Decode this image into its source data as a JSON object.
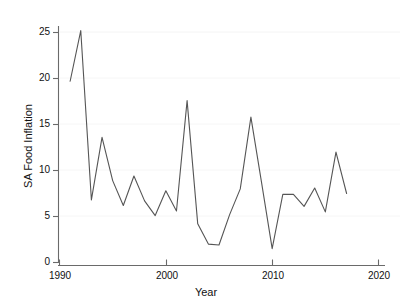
{
  "chart_data": {
    "type": "line",
    "title": "",
    "xlabel": "Year",
    "ylabel": "SA Food Inflation",
    "xlim": [
      1988.8,
      2022.5
    ],
    "ylim": [
      -1.2,
      26.8
    ],
    "xticks": [
      1990,
      2000,
      2010,
      2020
    ],
    "xtick_labels": [
      "1990",
      "2000",
      "2010",
      "2020"
    ],
    "yticks": [
      0,
      5,
      10,
      15,
      20,
      25
    ],
    "ytick_labels": [
      "0",
      "5",
      "10",
      "15",
      "20",
      "25"
    ],
    "grid": false,
    "legend": "none",
    "line_color": "#555555",
    "axis_color": "#555555",
    "background": "#ffffff",
    "x": [
      1991,
      1992,
      1993,
      1994,
      1995,
      1996,
      1997,
      1998,
      1999,
      2000,
      2001,
      2002,
      2003,
      2004,
      2005,
      2006,
      2007,
      2008,
      2009,
      2010,
      2011,
      2012,
      2013,
      2014,
      2015,
      2016,
      2017
    ],
    "values": [
      19.7,
      25.2,
      6.8,
      13.6,
      8.9,
      6.2,
      9.4,
      6.7,
      5.1,
      7.8,
      5.6,
      17.6,
      4.2,
      2.0,
      1.9,
      5.2,
      8.0,
      15.8,
      8.7,
      1.5,
      7.4,
      7.4,
      6.1,
      8.1,
      5.5,
      12.0,
      7.5
    ]
  },
  "axis_labels": {
    "x_title": "Year",
    "y_title": "SA Food Inflation"
  }
}
